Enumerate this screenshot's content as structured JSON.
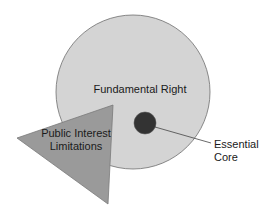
{
  "diagram": {
    "type": "concept-diagram",
    "shapes": {
      "fundamental_right": {
        "label": "Fundamental Right",
        "shape": "circle",
        "fill": "#d4d4d4",
        "stroke": "#6e6e6e"
      },
      "essential_core": {
        "label_line1": "Essential",
        "label_line2": "Core",
        "shape": "circle",
        "fill": "#333333"
      },
      "public_interest_limitations": {
        "label_line1": "Public Interest",
        "label_line2": "Limitations",
        "shape": "triangle",
        "fill": "#9a9a9a",
        "stroke": "#7a7a7a"
      }
    }
  }
}
